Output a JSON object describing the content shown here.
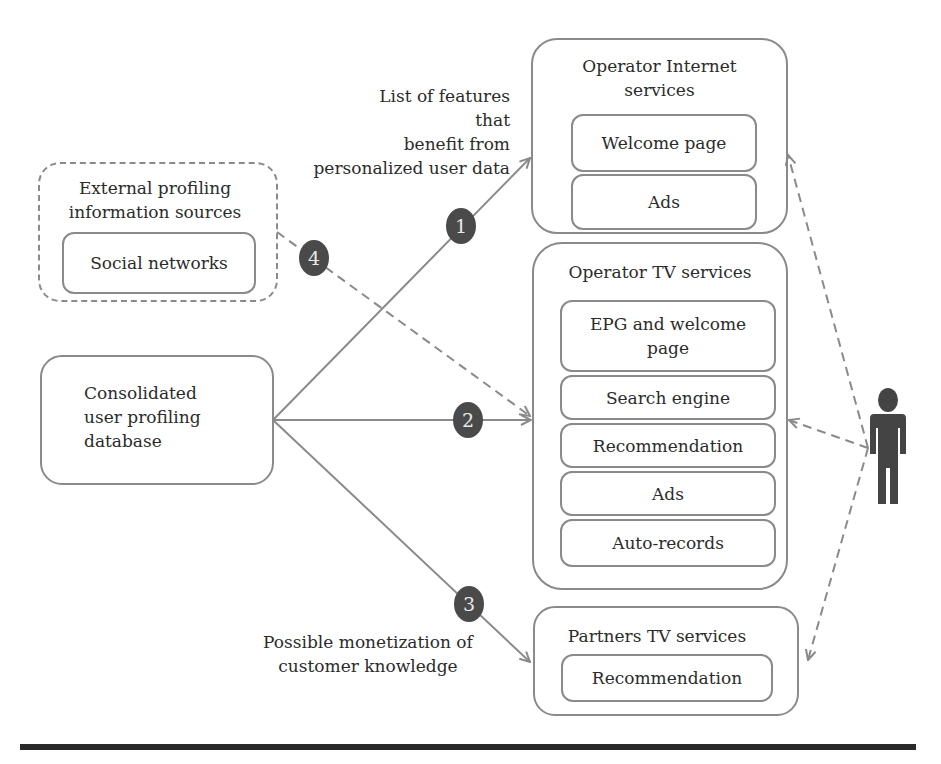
{
  "diagram": {
    "type": "flow",
    "nodes": {
      "external_sources": {
        "title": "External profiling information sources",
        "title_lines": [
          "External profiling",
          "information sources"
        ],
        "items": [
          "Social networks"
        ]
      },
      "consolidated_db": {
        "title_lines": [
          "Consolidated",
          "user profiling",
          "database"
        ]
      },
      "operator_internet": {
        "title_lines": [
          "Operator Internet",
          "services"
        ],
        "items": [
          "Welcome page",
          "Ads"
        ]
      },
      "operator_tv": {
        "title": "Operator TV services",
        "items": [
          "EPG and welcome page",
          "Search engine",
          "Recommendation",
          "Ads",
          "Auto-records"
        ],
        "item0_lines": [
          "EPG and welcome",
          "page"
        ]
      },
      "partners_tv": {
        "title": "Partners TV services",
        "items": [
          "Recommendation"
        ]
      },
      "user": {
        "icon": "person-icon"
      }
    },
    "badges": [
      "1",
      "2",
      "3",
      "4"
    ],
    "annotations": {
      "features": [
        "List of features that",
        "benefit from",
        "personalized user data"
      ],
      "monetization": [
        "Possible monetization of",
        "customer knowledge"
      ]
    },
    "edges": [
      {
        "from": "consolidated_db",
        "to": "operator_internet",
        "label": "1",
        "style": "solid"
      },
      {
        "from": "consolidated_db",
        "to": "operator_tv",
        "label": "2",
        "style": "solid"
      },
      {
        "from": "consolidated_db",
        "to": "partners_tv",
        "label": "3",
        "style": "solid"
      },
      {
        "from": "external_sources",
        "to": "operator_tv",
        "label": "4",
        "style": "dashed"
      },
      {
        "from": "user",
        "to": "operator_internet",
        "style": "dashed"
      },
      {
        "from": "user",
        "to": "operator_tv",
        "style": "dashed"
      },
      {
        "from": "user",
        "to": "partners_tv",
        "style": "dashed"
      }
    ],
    "colors": {
      "stroke": "#8a8a8a",
      "badge": "#4a4a4a",
      "person": "#444444",
      "rule": "#2a2a2a"
    }
  }
}
